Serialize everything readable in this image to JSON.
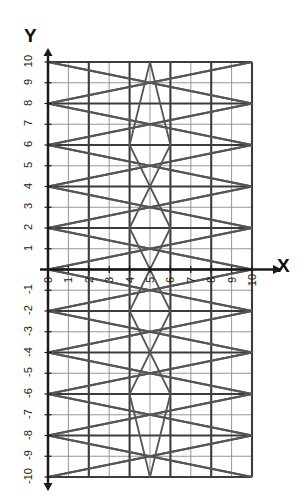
{
  "figure": {
    "background_color": "#ffffff",
    "axis_color": "#1a1a1a",
    "major_grid_color": "#3c3c3c",
    "minor_grid_color": "#8a8a8a",
    "curve_color": "#555555",
    "x_axis_title": "X",
    "y_axis_title": "Y"
  },
  "chart_data": {
    "type": "line",
    "title": "",
    "xlabel": "X",
    "ylabel": "Y",
    "xlim": [
      0,
      10
    ],
    "ylim": [
      -10,
      10
    ],
    "grid": true,
    "grid_major_step": 2,
    "grid_minor_step": 1,
    "legend": "none",
    "xticks": [
      0,
      1,
      2,
      3,
      4,
      5,
      6,
      7,
      8,
      9,
      10
    ],
    "xtick_labels": [
      "0",
      "1",
      "2",
      "3",
      "4",
      "5",
      "6",
      "7",
      "8",
      "9",
      "10"
    ],
    "yticks": [
      -10,
      -9,
      -8,
      -7,
      -6,
      -5,
      -4,
      -3,
      -2,
      -1,
      0,
      1,
      2,
      3,
      4,
      5,
      6,
      7,
      8,
      9,
      10
    ],
    "ytick_labels": [
      "-10",
      "-9",
      "-8",
      "-7",
      "-6",
      "-5",
      "-4",
      "-3",
      "-2",
      "-1",
      "0",
      "1",
      "2",
      "3",
      "4",
      "5",
      "6",
      "7",
      "8",
      "9",
      "10"
    ],
    "series": [
      {
        "name": "zigzag-1",
        "points": [
          [
            0,
            10
          ],
          [
            10,
            8
          ],
          [
            0,
            6
          ],
          [
            10,
            4
          ],
          [
            0,
            2
          ],
          [
            10,
            0
          ],
          [
            0,
            -2
          ],
          [
            10,
            -4
          ],
          [
            0,
            -6
          ],
          [
            10,
            -8
          ],
          [
            0,
            -10
          ]
        ]
      },
      {
        "name": "zigzag-2",
        "points": [
          [
            10,
            10
          ],
          [
            0,
            8
          ],
          [
            10,
            6
          ],
          [
            0,
            4
          ],
          [
            10,
            2
          ],
          [
            0,
            0
          ],
          [
            10,
            -2
          ],
          [
            0,
            -4
          ],
          [
            10,
            -6
          ],
          [
            0,
            -8
          ],
          [
            10,
            -10
          ]
        ]
      },
      {
        "name": "zigzag-3",
        "points": [
          [
            0,
            10
          ],
          [
            5,
            9
          ],
          [
            0,
            8
          ],
          [
            5,
            7
          ],
          [
            0,
            6
          ],
          [
            5,
            5
          ],
          [
            0,
            4
          ],
          [
            5,
            3
          ],
          [
            0,
            2
          ],
          [
            5,
            1
          ],
          [
            0,
            0
          ],
          [
            5,
            -1
          ],
          [
            0,
            -2
          ],
          [
            5,
            -3
          ],
          [
            0,
            -4
          ],
          [
            5,
            -5
          ],
          [
            0,
            -6
          ],
          [
            5,
            -7
          ],
          [
            0,
            -8
          ],
          [
            5,
            -9
          ],
          [
            0,
            -10
          ]
        ]
      },
      {
        "name": "zigzag-4",
        "points": [
          [
            10,
            10
          ],
          [
            5,
            9
          ],
          [
            10,
            8
          ],
          [
            5,
            7
          ],
          [
            10,
            6
          ],
          [
            5,
            5
          ],
          [
            10,
            4
          ],
          [
            5,
            3
          ],
          [
            10,
            2
          ],
          [
            5,
            1
          ],
          [
            10,
            0
          ],
          [
            5,
            -1
          ],
          [
            10,
            -2
          ],
          [
            5,
            -3
          ],
          [
            10,
            -4
          ],
          [
            5,
            -5
          ],
          [
            10,
            -6
          ],
          [
            5,
            -7
          ],
          [
            10,
            -8
          ],
          [
            5,
            -9
          ],
          [
            10,
            -10
          ]
        ]
      },
      {
        "name": "star-center",
        "points": [
          [
            5,
            10
          ],
          [
            4,
            6
          ],
          [
            5,
            4
          ],
          [
            6,
            6
          ],
          [
            5,
            10
          ]
        ]
      },
      {
        "name": "star-center-2",
        "points": [
          [
            5,
            4
          ],
          [
            4,
            2
          ],
          [
            5,
            0
          ],
          [
            6,
            2
          ],
          [
            5,
            4
          ]
        ]
      },
      {
        "name": "star-center-3",
        "points": [
          [
            5,
            0
          ],
          [
            4,
            -2
          ],
          [
            5,
            -4
          ],
          [
            6,
            -2
          ],
          [
            5,
            0
          ]
        ]
      },
      {
        "name": "star-center-4",
        "points": [
          [
            5,
            -4
          ],
          [
            4,
            -6
          ],
          [
            5,
            -10
          ],
          [
            6,
            -6
          ],
          [
            5,
            -4
          ]
        ]
      }
    ]
  }
}
